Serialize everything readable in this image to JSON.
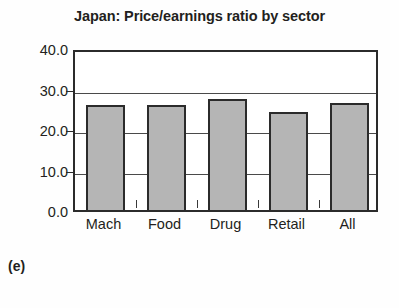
{
  "figure": {
    "panel_label": "(e)",
    "background_color": "#fefefe"
  },
  "chart_data": {
    "type": "bar",
    "title": "Japan: Price/earnings ratio by sector",
    "xlabel": "",
    "ylabel": "",
    "categories": [
      "Mach",
      "Food",
      "Drug",
      "Retail",
      "All"
    ],
    "values": [
      26.9,
      26.8,
      28.4,
      25.2,
      27.4
    ],
    "ylim": [
      0.0,
      40.0
    ],
    "yticks": [
      0.0,
      10.0,
      20.0,
      30.0,
      40.0
    ],
    "ytick_labels": [
      "0.0",
      "10.0",
      "20.0",
      "30.0",
      "40.0"
    ],
    "grid": true,
    "legend": false,
    "bar_color": "#b5b5b5",
    "bar_edge_color": "#2b2b2b",
    "axis_color": "#2b2b2b",
    "gridline_color": "#4a4a4a"
  }
}
